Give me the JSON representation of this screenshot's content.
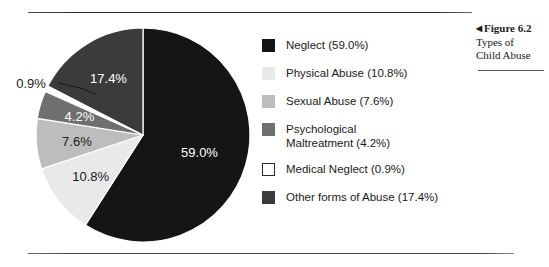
{
  "figure": {
    "caption_arrow": "◀",
    "caption_title": "Figure 6.2",
    "caption_line1": "Types of",
    "caption_line2": "Child Abuse"
  },
  "legend": {
    "items": [
      {
        "label": "Neglect (59.0%)",
        "color": "#151515",
        "border": "#151515"
      },
      {
        "label": "Physical Abuse (10.8%)",
        "color": "#e9e9e9",
        "border": "#e9e9e9"
      },
      {
        "label": "Sexual Abuse (7.6%)",
        "color": "#bdbdbd",
        "border": "#bdbdbd"
      },
      {
        "label": "Psychological\nMaltreatment (4.2%)",
        "color": "#6f6f6f",
        "border": "#6f6f6f"
      },
      {
        "label": "Medical Neglect (0.9%)",
        "color": "#ffffff",
        "border": "#2a2a2a"
      },
      {
        "label": "Other forms of Abuse (17.4%)",
        "color": "#3b3b3b",
        "border": "#3b3b3b"
      }
    ]
  },
  "chart_data": {
    "type": "pie",
    "title": "Types of Child Abuse",
    "categories": [
      "Neglect",
      "Physical Abuse",
      "Sexual Abuse",
      "Psychological Maltreatment",
      "Medical Neglect",
      "Other forms of Abuse"
    ],
    "values": [
      59.0,
      10.8,
      7.6,
      4.2,
      0.9,
      17.4
    ],
    "value_labels": [
      "59.0%",
      "10.8%",
      "7.6%",
      "4.2%",
      "0.9%",
      "17.4%"
    ],
    "colors": [
      "#151515",
      "#e9e9e9",
      "#bdbdbd",
      "#6f6f6f",
      "#ffffff",
      "#3b3b3b"
    ],
    "label_text_colors": [
      "#ffffff",
      "#1a1a1a",
      "#1a1a1a",
      "#ffffff",
      "#1a1a1a",
      "#ffffff"
    ],
    "label_placement": [
      "inside",
      "inside",
      "inside",
      "inside",
      "outside",
      "inside"
    ],
    "units": "percent",
    "start_angle_deg": 0,
    "direction": "clockwise",
    "legend_position": "right",
    "grid": false
  }
}
